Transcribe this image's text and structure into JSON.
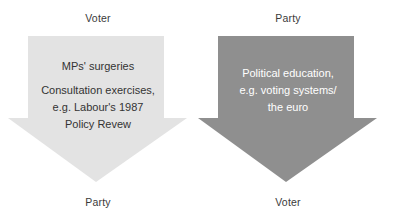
{
  "diagram": {
    "type": "two-way-communication-flow",
    "flows": [
      {
        "id": "voter-to-party",
        "source_label": "Voter",
        "target_label": "Party",
        "direction": "down",
        "fill_color": "#e3e3e3",
        "text_color": "#333333",
        "lines": [
          "MPs' surgeries",
          "Consultation exercises,",
          "e.g. Labour's 1987",
          "Policy Revew"
        ]
      },
      {
        "id": "party-to-voter",
        "source_label": "Party",
        "target_label": "Voter",
        "direction": "down",
        "fill_color": "#8f8f8f",
        "text_color": "#ffffff",
        "lines": [
          "Political education,",
          "e.g. voting systems/",
          "the euro"
        ]
      }
    ]
  }
}
